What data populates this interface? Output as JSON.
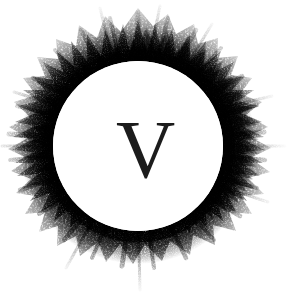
{
  "artwork": {
    "title": "Charcoal Sunburst Monogram",
    "width": 293,
    "height": 296,
    "background_color": "#ffffff"
  },
  "monogram": {
    "letter": "V",
    "color": "#1c1c1c",
    "style": "serif",
    "cap_height_px": 57,
    "center_x": 137,
    "baseline_y": 178
  },
  "disc": {
    "name": "inner-white-disc",
    "center_x": 138,
    "center_y": 146,
    "radius": 85,
    "fill": "#ffffff"
  },
  "burst": {
    "name": "charcoal-sunburst-ring",
    "inner_radius": 85,
    "max_outer_radius": 146,
    "core_color": "#242424",
    "mid_color": "#585858",
    "edge_color": "#c8c8c8",
    "texture": "stippled-charcoal-grain",
    "spike_count": 96,
    "description": "Irregular radiating charcoal spikes, densest at the disc rim and dissolving into grain toward the outer edge."
  }
}
